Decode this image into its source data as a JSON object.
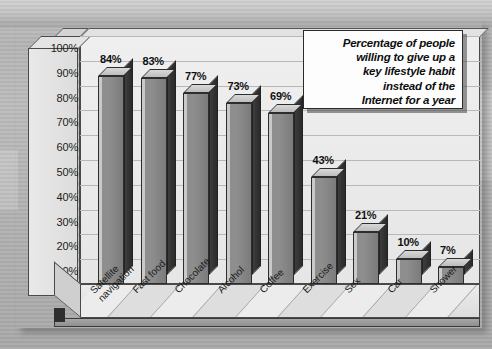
{
  "chart_data": {
    "type": "bar",
    "title_lines": [
      "Percentage of people",
      "willing to give up a",
      "key lifestyle habit",
      "instead of the",
      "Internet for a year"
    ],
    "categories": [
      "Satellite navigation",
      "Fast food",
      "Chocolate",
      "Alcohol",
      "Coffee",
      "Exercise",
      "Sex",
      "Car",
      "Shower"
    ],
    "category_lines": [
      [
        "Satellite",
        "navigation"
      ],
      [
        "Fast food"
      ],
      [
        "Chocolate"
      ],
      [
        "Alcohol"
      ],
      [
        "Coffee"
      ],
      [
        "Exercise"
      ],
      [
        "Sex"
      ],
      [
        "Car"
      ],
      [
        "Shower"
      ]
    ],
    "values": [
      84,
      83,
      77,
      73,
      69,
      43,
      21,
      10,
      7
    ],
    "value_labels": [
      "84%",
      "83%",
      "77%",
      "73%",
      "69%",
      "43%",
      "21%",
      "10%",
      "7%"
    ],
    "xlabel": "",
    "ylabel": "",
    "ylim": [
      0,
      100
    ],
    "ytick_values": [
      100,
      90,
      80,
      70,
      60,
      50,
      40,
      30,
      20,
      10,
      0
    ],
    "ytick_labels": [
      "100%",
      "90%",
      "80%",
      "70%",
      "60%",
      "50%",
      "40%",
      "30%",
      "20%",
      "10%",
      "0%"
    ],
    "grid": true,
    "legend": "none",
    "style": "3d-extruded-bars",
    "colors": {
      "bar_front": "#8e8e8e",
      "bar_side": "#2f2f2f",
      "bar_top": "#cccccc",
      "plot_background": "#e9e9e9",
      "page_background": "#b8b8b8",
      "text": "#131313",
      "gridline": "#b8b8b8"
    }
  }
}
